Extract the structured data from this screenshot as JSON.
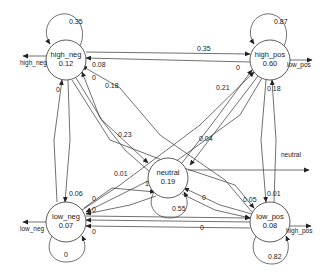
{
  "diagram": {
    "type": "state-transition",
    "nodes": [
      {
        "id": "high_neg",
        "label": "high_neg",
        "value": "0.12",
        "cx": 66,
        "cy": 60
      },
      {
        "id": "high_pos",
        "label": "high_pos",
        "value": "0.60",
        "cx": 270,
        "cy": 60
      },
      {
        "id": "neutral",
        "label": "neutral",
        "value": "0.19",
        "cx": 168,
        "cy": 178
      },
      {
        "id": "low_neg",
        "label": "low_neg",
        "value": "0.07",
        "cx": 66,
        "cy": 222
      },
      {
        "id": "low_pos",
        "label": "low_pos",
        "value": "0.08",
        "cx": 270,
        "cy": 222
      }
    ],
    "self_loops": [
      {
        "node": "high_neg",
        "label": "0.35"
      },
      {
        "node": "high_pos",
        "label": "0.87"
      },
      {
        "node": "neutral",
        "label": "0.55"
      },
      {
        "node": "low_neg",
        "label": "0"
      },
      {
        "node": "low_pos",
        "label": "0.82"
      }
    ],
    "outputs": [
      {
        "node": "high_neg",
        "label": "high_neg"
      },
      {
        "node": "high_pos",
        "label": "low_pos"
      },
      {
        "node": "neutral",
        "label": "neutral"
      },
      {
        "node": "low_neg",
        "label": "low_neg"
      },
      {
        "node": "low_pos",
        "label": "high_pos"
      }
    ],
    "edge_labels": [
      {
        "text": "0.35",
        "x": 197,
        "y": 51
      },
      {
        "text": "0.08",
        "x": 92,
        "y": 67
      },
      {
        "text": "0",
        "x": 92,
        "y": 80
      },
      {
        "text": "0.18",
        "x": 105,
        "y": 88
      },
      {
        "text": "0",
        "x": 56,
        "y": 92
      },
      {
        "text": "0.23",
        "x": 118,
        "y": 137
      },
      {
        "text": "0",
        "x": 236,
        "y": 70
      },
      {
        "text": "0.21",
        "x": 216,
        "y": 90
      },
      {
        "text": "0.18",
        "x": 267,
        "y": 91
      },
      {
        "text": "0.04",
        "x": 199,
        "y": 141
      },
      {
        "text": "0.06",
        "x": 69,
        "y": 196
      },
      {
        "text": "0.01",
        "x": 114,
        "y": 176
      },
      {
        "text": "1",
        "x": 145,
        "y": 186
      },
      {
        "text": "0",
        "x": 92,
        "y": 201
      },
      {
        "text": "0",
        "x": 92,
        "y": 212
      },
      {
        "text": "0",
        "x": 92,
        "y": 234
      },
      {
        "text": "0",
        "x": 202,
        "y": 200
      },
      {
        "text": "0.05",
        "x": 243,
        "y": 202
      },
      {
        "text": "0.01",
        "x": 267,
        "y": 196
      },
      {
        "text": "0",
        "x": 200,
        "y": 230
      }
    ]
  }
}
